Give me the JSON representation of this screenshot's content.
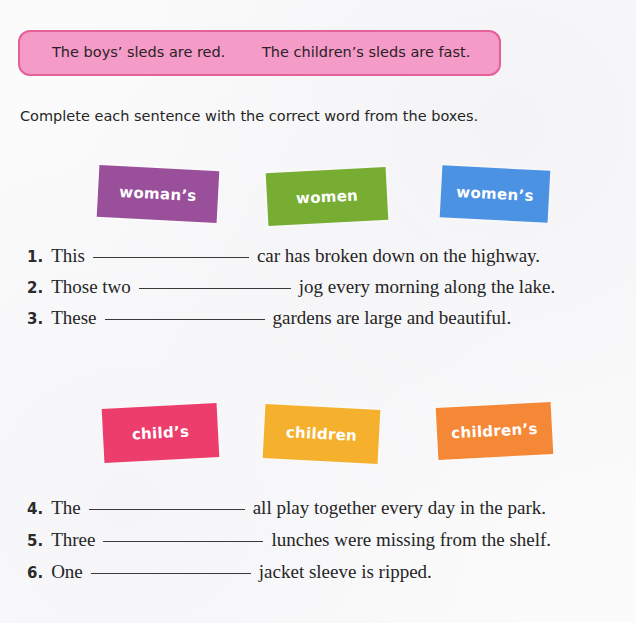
{
  "example": {
    "sentences": [
      "The boys’ sleds are red.",
      "The children’s sleds are fast."
    ],
    "box_color": "#f49bc8",
    "border_color": "#e55f98"
  },
  "instruction": "Complete each sentence with the correct word from the boxes.",
  "word_banks": [
    {
      "cards": [
        {
          "word": "woman’s",
          "color": "#9a4f9a"
        },
        {
          "word": "women",
          "color": "#78ad33"
        },
        {
          "word": "women’s",
          "color": "#4c92e3"
        }
      ]
    },
    {
      "cards": [
        {
          "word": "child’s",
          "color": "#ec3d6c"
        },
        {
          "word": "children",
          "color": "#f5b12e"
        },
        {
          "word": "children’s",
          "color": "#f58837"
        }
      ]
    }
  ],
  "exercises": [
    {
      "number": "1.",
      "before": "This",
      "after": "car has broken down on the highway.",
      "answer": ""
    },
    {
      "number": "2.",
      "before": "Those two",
      "after": "jog every morning along the lake.",
      "answer": ""
    },
    {
      "number": "3.",
      "before": "These",
      "after": "gardens are large and beautiful.",
      "answer": ""
    },
    {
      "number": "4.",
      "before": "The",
      "after": "all play together every day in the park.",
      "answer": ""
    },
    {
      "number": "5.",
      "before": "Three",
      "after": "lunches were missing from the shelf.",
      "answer": ""
    },
    {
      "number": "6.",
      "before": "One",
      "after": "jacket sleeve is ripped.",
      "answer": ""
    }
  ]
}
